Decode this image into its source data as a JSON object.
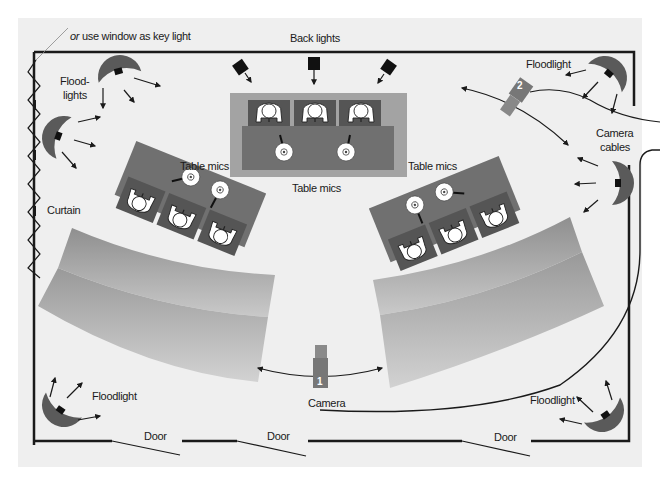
{
  "diagram": {
    "colors": {
      "background": "#efefef",
      "wall": "#1a1a1a",
      "table": "#6e6e6e",
      "stage_platform": "#9a9a9a",
      "seat": "#545454",
      "umbrella": "#5a5a5a",
      "person": "#ffffff",
      "camera": "#777777"
    },
    "labels": {
      "window_note_prefix": "or",
      "window_note_rest": " use window as key light",
      "back_lights": "Back lights",
      "floodlights_top_left_1": "Flood-",
      "floodlights_top_left_2": "lights",
      "curtain": "Curtain",
      "table_mics_left": "Table mics",
      "table_mics_center": "Table mics",
      "table_mics_right": "Table mics",
      "floodlight_top_right": "Floodlight",
      "camera_cables_1": "Camera",
      "camera_cables_2": "cables",
      "floodlight_bottom_left": "Floodlight",
      "floodlight_bottom_right": "Floodlight",
      "camera": "Camera",
      "door_1": "Door",
      "door_2": "Door",
      "door_3": "Door"
    },
    "cameras": [
      {
        "id": "camera-1",
        "number": "1"
      },
      {
        "id": "camera-2",
        "number": "2"
      }
    ],
    "tables": [
      {
        "name": "center-table",
        "seats": 3,
        "mics": 2
      },
      {
        "name": "left-table",
        "seats": 3,
        "mics": 2
      },
      {
        "name": "right-table",
        "seats": 3,
        "mics": 2
      }
    ],
    "audience_rows": {
      "left": 2,
      "right": 2
    },
    "lights": {
      "back_lights": 3,
      "floodlights": 5
    },
    "doors": 3
  }
}
